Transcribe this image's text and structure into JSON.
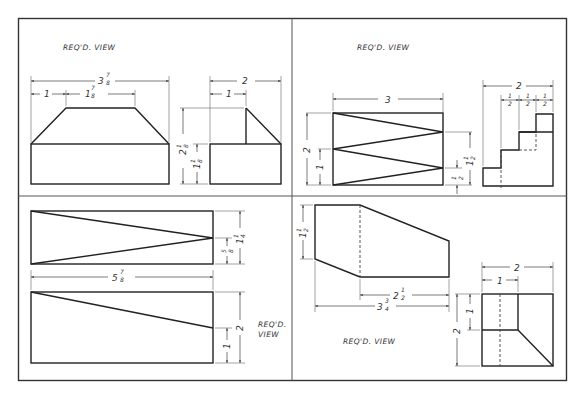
{
  "sheet": {
    "stroke_color": "#222222",
    "background": "#ffffff"
  },
  "panels": {
    "top_left": {
      "label": "REQ'D. VIEW",
      "dims": {
        "overall_width_whole": "3",
        "overall_width_frac_num": "7",
        "overall_width_frac_den": "8",
        "left_offset": "1",
        "top_width_whole": "1",
        "top_width_frac_num": "7",
        "top_width_frac_den": "8",
        "side_width": "2",
        "side_offset": "1",
        "total_height_whole": "2",
        "total_height_frac_num": "1",
        "total_height_frac_den": "8",
        "base_height_whole": "1",
        "base_height_frac_num": "1",
        "base_height_frac_den": "8"
      }
    },
    "top_right": {
      "label": "REQ'D. VIEW",
      "dims": {
        "front_width": "3",
        "total_height": "2",
        "lower_height": "1",
        "right_upper_whole": "1",
        "right_upper_frac_num": "1",
        "right_upper_frac_den": "2",
        "right_lower_frac_num": "1",
        "right_lower_frac_den": "2",
        "side_width": "2",
        "step_1_num": "1",
        "step_1_den": "2",
        "step_2_num": "1",
        "step_2_den": "2",
        "step_3_num": "1",
        "step_3_den": "2"
      }
    },
    "bottom_left": {
      "label_line1": "REQ'D.",
      "label_line2": "VIEW",
      "dims": {
        "overall_width_whole": "5",
        "overall_width_frac_num": "7",
        "overall_width_frac_den": "8",
        "top_view_height_whole": "1",
        "top_view_height_frac_num": "1",
        "top_view_height_frac_den": "4",
        "top_view_half_frac_num": "5",
        "top_view_half_frac_den": "8",
        "front_height": "2",
        "front_low_height": "1"
      }
    },
    "bottom_right": {
      "label": "REQ'D. VIEW",
      "dims": {
        "left_height_whole": "1",
        "left_height_frac_num": "1",
        "left_height_frac_den": "2",
        "inner_width_whole": "2",
        "inner_width_frac_num": "1",
        "inner_width_frac_den": "2",
        "overall_width_whole": "3",
        "overall_width_frac_num": "3",
        "overall_width_frac_den": "4",
        "side_width": "2",
        "side_offset": "1",
        "side_height": "2",
        "side_upper_height": "1"
      }
    }
  }
}
